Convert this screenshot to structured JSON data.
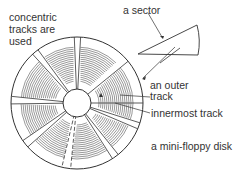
{
  "labels": {
    "concentric_line1": "concentric",
    "concentric_line2": "tracks are",
    "concentric_line3": "used",
    "sector": "a sector",
    "outer_track_line1": "an outer",
    "outer_track_line2": "track",
    "innermost_track": "innermost track",
    "caption": "a mini-floppy disk"
  },
  "colors": {
    "line": "#333333",
    "background": "#ffffff"
  }
}
